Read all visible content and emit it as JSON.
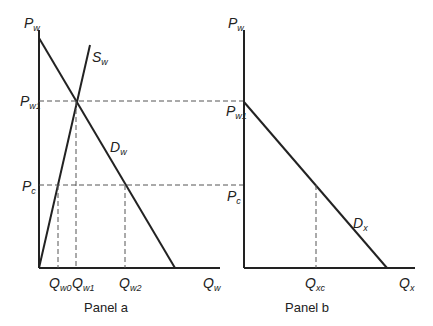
{
  "panel_a": {
    "caption": "Panel a",
    "y_axis": {
      "main": "P",
      "sub": "w"
    },
    "x_axis": {
      "main": "Q",
      "sub": "w"
    },
    "supply": {
      "main": "S",
      "sub": "w"
    },
    "demand": {
      "main": "D",
      "sub": "w"
    },
    "price_labels": [
      {
        "main": "P",
        "sub": "w1"
      },
      {
        "main": "P",
        "sub": "c"
      }
    ],
    "quantity_labels": [
      {
        "main": "Q",
        "sub": "w0"
      },
      {
        "main": "Q",
        "sub": "w1"
      },
      {
        "main": "Q",
        "sub": "w2"
      }
    ]
  },
  "panel_b": {
    "caption": "Panel b",
    "y_axis": {
      "main": "P",
      "sub": "w"
    },
    "x_axis": {
      "main": "Q",
      "sub": "x"
    },
    "demand": {
      "main": "D",
      "sub": "x"
    },
    "price_labels": [
      {
        "main": "P",
        "sub": "w1"
      },
      {
        "main": "P",
        "sub": "c"
      }
    ],
    "quantity_labels": [
      {
        "main": "Q",
        "sub": "xc"
      }
    ]
  }
}
